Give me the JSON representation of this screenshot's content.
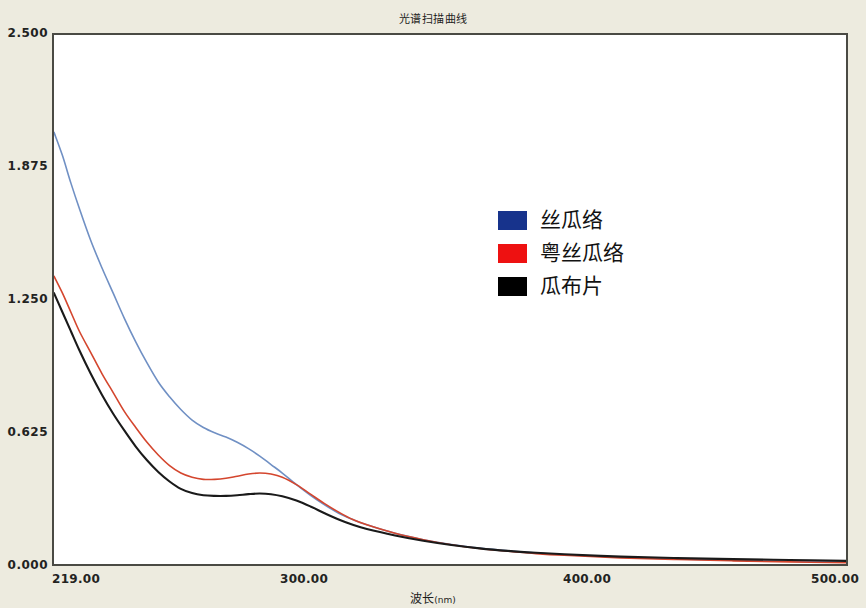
{
  "chart_data": {
    "type": "line",
    "title": "光谱扫描曲线",
    "xlabel_main": "波长",
    "xlabel_unit": "(nm)",
    "ylabel": "",
    "xlim": [
      219.0,
      500.0
    ],
    "ylim": [
      0.0,
      2.5
    ],
    "grid": false,
    "legend_position": "center",
    "xticks": [
      "219.00",
      "300.00",
      "400.00",
      "500.00"
    ],
    "xtick_values": [
      219.0,
      300.0,
      400.0,
      500.0
    ],
    "yticks": [
      "0.000",
      "0.625",
      "1.250",
      "1.875",
      "2.500"
    ],
    "ytick_values": [
      0.0,
      0.625,
      1.25,
      1.875,
      2.5
    ],
    "x": [
      219,
      222,
      225,
      228,
      232,
      236,
      240,
      244,
      248,
      252,
      256,
      260,
      264,
      268,
      272,
      276,
      280,
      284,
      288,
      292,
      296,
      300,
      305,
      310,
      315,
      320,
      325,
      330,
      340,
      350,
      360,
      370,
      380,
      390,
      400,
      420,
      440,
      460,
      480,
      500
    ],
    "series": [
      {
        "name": "丝瓜络",
        "color": "#17338c",
        "line_color": "#7090c4",
        "values": [
          2.04,
          1.93,
          1.8,
          1.68,
          1.53,
          1.4,
          1.28,
          1.16,
          1.05,
          0.95,
          0.86,
          0.79,
          0.73,
          0.68,
          0.645,
          0.62,
          0.6,
          0.575,
          0.545,
          0.51,
          0.47,
          0.43,
          0.375,
          0.325,
          0.28,
          0.24,
          0.21,
          0.185,
          0.145,
          0.115,
          0.092,
          0.075,
          0.062,
          0.052,
          0.044,
          0.032,
          0.024,
          0.018,
          0.013,
          0.009
        ]
      },
      {
        "name": "粤丝瓜络",
        "color": "#ee1111",
        "line_color": "#d4462e",
        "values": [
          1.36,
          1.28,
          1.19,
          1.1,
          1.0,
          0.9,
          0.81,
          0.72,
          0.645,
          0.575,
          0.515,
          0.465,
          0.43,
          0.41,
          0.4,
          0.4,
          0.405,
          0.415,
          0.425,
          0.43,
          0.425,
          0.41,
          0.375,
          0.33,
          0.285,
          0.245,
          0.21,
          0.185,
          0.145,
          0.115,
          0.091,
          0.073,
          0.06,
          0.049,
          0.041,
          0.029,
          0.021,
          0.015,
          0.01,
          0.006
        ]
      },
      {
        "name": "瓜布片",
        "color": "#000000",
        "line_color": "#1a1a1a",
        "values": [
          1.28,
          1.19,
          1.1,
          1.01,
          0.9,
          0.8,
          0.71,
          0.63,
          0.555,
          0.49,
          0.435,
          0.39,
          0.355,
          0.335,
          0.325,
          0.322,
          0.322,
          0.325,
          0.33,
          0.333,
          0.33,
          0.32,
          0.3,
          0.272,
          0.24,
          0.21,
          0.185,
          0.165,
          0.135,
          0.11,
          0.09,
          0.074,
          0.062,
          0.053,
          0.046,
          0.035,
          0.028,
          0.023,
          0.019,
          0.015
        ]
      }
    ]
  },
  "legend": {
    "items": [
      {
        "label": "丝瓜络",
        "color": "#17338c"
      },
      {
        "label": "粤丝瓜络",
        "color": "#ee1111"
      },
      {
        "label": "瓜布片",
        "color": "#000000"
      }
    ]
  }
}
